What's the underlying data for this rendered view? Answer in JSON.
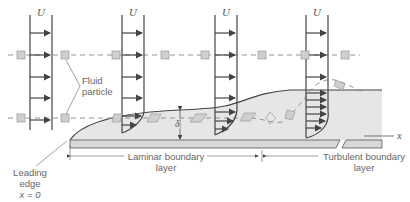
{
  "labels": {
    "velocity_symbol": "U",
    "fluid_particle_line1": "Fluid",
    "fluid_particle_line2": "particle",
    "laminar_line1": "Laminar boundary",
    "laminar_line2": "layer",
    "turbulent_line1": "Turbulent boundary",
    "turbulent_line2": "layer",
    "leading_line1": "Leading",
    "leading_line2": "edge",
    "leading_line3": "x = 0",
    "thickness_symbol": "δ",
    "x_axis": "x"
  },
  "colors": {
    "line": "#444444",
    "boundary_fill": "#e6e6e6",
    "plate_fill": "#d8d8d8",
    "particle_fill": "#cfcfcf",
    "dash": "#888888",
    "text": "#666666"
  }
}
